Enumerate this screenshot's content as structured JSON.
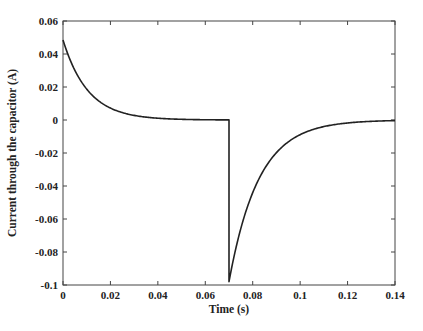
{
  "chart_data": {
    "type": "line",
    "title": "",
    "xlabel": "Time (s)",
    "ylabel": "Current through the capacitor (A)",
    "xlim": [
      0,
      0.14
    ],
    "ylim": [
      -0.1,
      0.06
    ],
    "grid": false,
    "legend": null,
    "xticks": [
      0,
      0.02,
      0.04,
      0.06,
      0.08,
      0.1,
      0.12,
      0.14
    ],
    "xtick_labels": [
      "0",
      "0.02",
      "0.04",
      "0.06",
      "0.08",
      "0.1",
      "0.12",
      "0.14"
    ],
    "yticks": [
      0.06,
      0.04,
      0.02,
      0,
      -0.02,
      -0.04,
      -0.06,
      -0.08,
      -0.1
    ],
    "ytick_labels": [
      "0.06",
      "0.04",
      "0.02",
      "0",
      "-0.02",
      "-0.04",
      "-0.06",
      "-0.08",
      "-0.1"
    ],
    "series": [
      {
        "name": "capacitor current",
        "color": "#222222",
        "description": "Exponential decay from ~0.0485 A at t=0 toward 0; at t=0.07 s step drop to ~-0.098 A then exponential recovery toward 0",
        "model": {
          "segment1": {
            "t_start": 0,
            "t_end": 0.07,
            "i0": 0.0485,
            "tau": 0.0105
          },
          "segment2": {
            "t_start": 0.07,
            "t_end": 0.14,
            "i0": -0.098,
            "tau": 0.0125
          }
        },
        "x": [
          0,
          0.005,
          0.01,
          0.015,
          0.02,
          0.03,
          0.04,
          0.05,
          0.06,
          0.07,
          0.07,
          0.075,
          0.08,
          0.085,
          0.09,
          0.1,
          0.11,
          0.12,
          0.13,
          0.14
        ],
        "values": [
          0.0485,
          0.03,
          0.0187,
          0.0116,
          0.0072,
          0.0028,
          0.0011,
          0.0004,
          0.0002,
          0.0001,
          -0.098,
          -0.0657,
          -0.044,
          -0.0295,
          -0.0198,
          -0.0089,
          -0.004,
          -0.0018,
          -0.0008,
          -0.0004
        ]
      }
    ]
  }
}
